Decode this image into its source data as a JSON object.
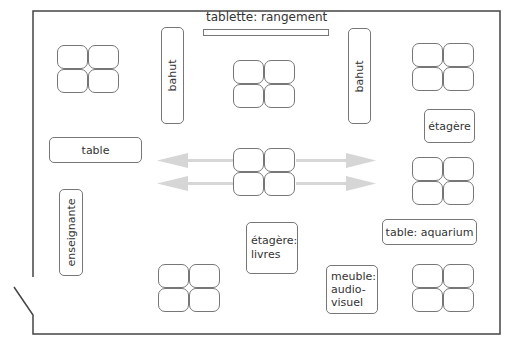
{
  "diagram": {
    "colors": {
      "wall": "#444444",
      "furniture_border": "#777777",
      "arrow": "#d4d4d4"
    },
    "labels": {
      "tablette": "tablette: rangement",
      "bahut_left": "bahut",
      "bahut_right": "bahut",
      "etagere": "étagère",
      "table": "table",
      "enseignante": "enseignante",
      "etagere_livres_line1": "étagère:",
      "etagere_livres_line2": "livres",
      "table_aquarium": "table: aquarium",
      "meuble_line1": "meuble:",
      "meuble_line2": "audio-",
      "meuble_line3": "visuel"
    },
    "desk_clusters": [
      {
        "id": "top-left",
        "desks": 4
      },
      {
        "id": "top-center",
        "desks": 4
      },
      {
        "id": "top-right",
        "desks": 4
      },
      {
        "id": "center",
        "desks": 4
      },
      {
        "id": "middle-right",
        "desks": 4
      },
      {
        "id": "bottom-center",
        "desks": 4
      },
      {
        "id": "bottom-right",
        "desks": 4
      }
    ],
    "arrows": [
      {
        "direction": "left",
        "row": "upper"
      },
      {
        "direction": "left",
        "row": "lower"
      },
      {
        "direction": "right",
        "row": "upper"
      },
      {
        "direction": "right",
        "row": "lower"
      }
    ]
  }
}
